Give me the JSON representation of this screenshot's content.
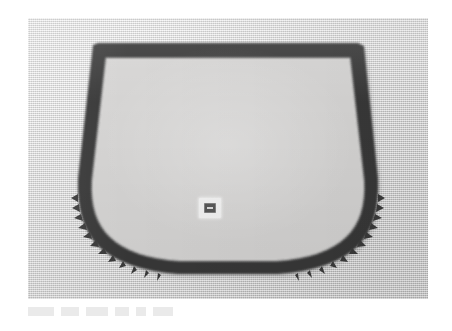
{
  "page": {
    "background_color": "#ffffff",
    "width": 452,
    "height": 331
  },
  "photograph": {
    "name": "scanned-photograph",
    "description": "Black and white scanned photograph of an automotive windshield seal gasket lying on a light textured surface",
    "background_color": "#d8d8d8",
    "interior_color": "#ebebeb",
    "frame": {
      "left": 28,
      "top": 18,
      "width": 400,
      "height": 281
    }
  },
  "object": {
    "name": "windshield-seal-gasket",
    "outline_color": "#3a3a3a",
    "band_color": "#373737",
    "interior_fill": "#ebeae8",
    "shape": "trapezoid-with-rounded-lower-corners",
    "features": [
      "straight thick top rail",
      "slanted left and right side rails widening downward",
      "rounded bottom-left corner",
      "rounded bottom-right corner",
      "serrated comb-like teeth along lower curves",
      "flat bottom rail"
    ]
  },
  "center_hardware": {
    "name": "center-mounting-button",
    "patch_color": "#f2f2f2",
    "button_color": "#4a4a4a",
    "left": 171,
    "top": 180,
    "width": 22,
    "height": 20
  },
  "caption_ghost": {
    "name": "faint-caption-smudge",
    "text": "",
    "color": "#bdbdbd",
    "opacity": 0.3,
    "segment_widths": [
      26,
      18,
      22,
      14,
      10,
      20
    ]
  }
}
